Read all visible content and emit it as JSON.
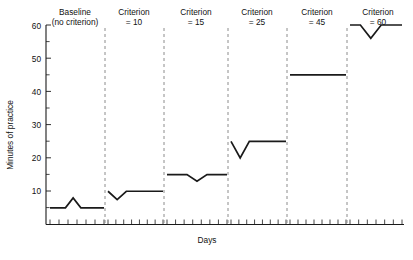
{
  "chart_data": {
    "type": "line",
    "title": "",
    "xlabel": "Days",
    "ylabel": "Minutes of practice",
    "ylim": [
      0,
      60
    ],
    "yticks": [
      10,
      20,
      30,
      40,
      50,
      60
    ],
    "ytick_labels": [
      "10",
      "20",
      "30",
      "40",
      "50",
      "60"
    ],
    "xticks_visible": true,
    "xtick_labels": [],
    "grid": false,
    "legend": false,
    "panel_separator": "dashed vertical line",
    "panels": [
      {
        "label_line1": "Baseline",
        "label_line2": "(no criterion)",
        "criterion": null,
        "days": [
          1,
          2,
          3,
          4,
          5,
          6,
          7,
          8
        ],
        "values": [
          5,
          5,
          5,
          8,
          5,
          5,
          5,
          5
        ]
      },
      {
        "label_line1": "Criterion",
        "label_line2": "= 10",
        "criterion": 10,
        "days": [
          1,
          2,
          3,
          4,
          5,
          6,
          7
        ],
        "values": [
          10,
          7.5,
          10,
          10,
          10,
          10,
          10
        ]
      },
      {
        "label_line1": "Criterion",
        "label_line2": "= 15",
        "criterion": 15,
        "days": [
          1,
          2,
          3,
          4,
          5,
          6,
          7
        ],
        "values": [
          15,
          15,
          15,
          13,
          15,
          15,
          15
        ]
      },
      {
        "label_line1": "Criterion",
        "label_line2": "= 25",
        "criterion": 25,
        "days": [
          1,
          2,
          3,
          4,
          5,
          6,
          7
        ],
        "values": [
          25,
          20,
          25,
          25,
          25,
          25,
          25
        ]
      },
      {
        "label_line1": "Criterion",
        "label_line2": "= 45",
        "criterion": 45,
        "days": [
          1,
          2,
          3,
          4,
          5,
          6,
          7
        ],
        "values": [
          45,
          45,
          45,
          45,
          45,
          45,
          45
        ]
      },
      {
        "label_line1": "Criterion",
        "label_line2": "= 60",
        "criterion": 60,
        "days": [
          1,
          2,
          3,
          4,
          5,
          6
        ],
        "values": [
          60,
          60,
          56,
          60,
          60,
          60
        ]
      }
    ]
  },
  "colors": {
    "line": "#1a1a1a",
    "axis": "#1a1a1a",
    "separator": "#8c8c8c",
    "background": "#ffffff"
  }
}
